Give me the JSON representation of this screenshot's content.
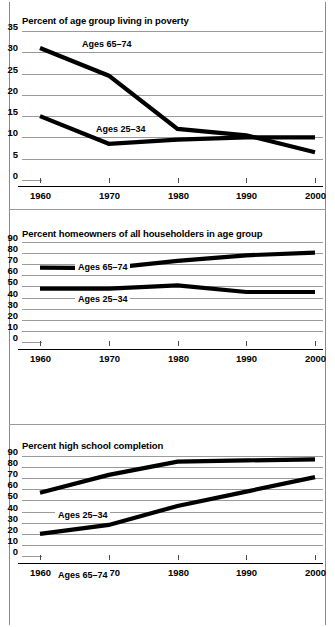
{
  "figure": {
    "panels": [
      "poverty",
      "homeowners",
      "education"
    ],
    "background_color": "#ffffff",
    "line_color": "#000000",
    "gridline_color": "#9a9a9a"
  },
  "poverty": {
    "title": "Percent of age group living in poverty",
    "series_label_older": "Ages 65–74",
    "series_label_younger": "Ages 25–34",
    "ytick_labels": [
      "0",
      "5",
      "10",
      "15",
      "20",
      "25",
      "30",
      "35"
    ],
    "xtick_labels": [
      "1960",
      "1970",
      "1980",
      "1990",
      "2000"
    ]
  },
  "homeowners": {
    "title": "Percent homeowners of all householders in age group",
    "series_label_older": "Ages 65–74",
    "series_label_younger": "Ages 25–34",
    "ytick_labels": [
      "0",
      "10",
      "20",
      "30",
      "40",
      "50",
      "60",
      "70",
      "80",
      "90"
    ],
    "xtick_labels": [
      "1960",
      "1970",
      "1980",
      "1990",
      "2000"
    ]
  },
  "education": {
    "title": "Percent high school completion",
    "series_label_older": "Ages 65–74",
    "series_label_younger": "Ages 25–34",
    "ytick_labels": [
      "0",
      "10",
      "20",
      "30",
      "40",
      "50",
      "60",
      "70",
      "80",
      "90"
    ],
    "xtick_labels": [
      "1960",
      "1970",
      "1980",
      "1990",
      "2000"
    ]
  },
  "chart_data": [
    {
      "type": "line",
      "id": "poverty",
      "title": "Percent of age group living in poverty",
      "xlabel": "",
      "ylabel": "",
      "x": [
        1960,
        1970,
        1980,
        1990,
        2000
      ],
      "categories": [
        "1960",
        "1970",
        "1980",
        "1990",
        "2000"
      ],
      "xlim": [
        1960,
        2000
      ],
      "ylim": [
        0,
        35
      ],
      "yticks": [
        0,
        5,
        10,
        15,
        20,
        25,
        30,
        35
      ],
      "grid": true,
      "legend": "inline-labels",
      "series": [
        {
          "name": "Ages 65–74",
          "values": [
            31,
            24.5,
            12,
            10.5,
            6.5
          ]
        },
        {
          "name": "Ages 25–34",
          "values": [
            15,
            8.5,
            9.5,
            10,
            10
          ]
        }
      ]
    },
    {
      "type": "line",
      "id": "homeowners",
      "title": "Percent homeowners of all householders in age group",
      "xlabel": "",
      "ylabel": "",
      "x": [
        1960,
        1970,
        1980,
        1990,
        2000
      ],
      "categories": [
        "1960",
        "1970",
        "1980",
        "1990",
        "2000"
      ],
      "xlim": [
        1960,
        2000
      ],
      "ylim": [
        0,
        90
      ],
      "yticks": [
        0,
        10,
        20,
        30,
        40,
        50,
        60,
        70,
        80,
        90
      ],
      "grid": true,
      "legend": "inline-labels",
      "series": [
        {
          "name": "Ages 65–74",
          "values": [
            67,
            66.5,
            73,
            78,
            80.5
          ]
        },
        {
          "name": "Ages 25–34",
          "values": [
            48,
            48,
            51,
            45,
            45
          ]
        }
      ]
    },
    {
      "type": "line",
      "id": "education",
      "title": "Percent high school completion",
      "xlabel": "",
      "ylabel": "",
      "x": [
        1960,
        1970,
        1980,
        1990,
        2000
      ],
      "categories": [
        "1960",
        "1970",
        "1980",
        "1990",
        "2000"
      ],
      "xlim": [
        1960,
        2000
      ],
      "ylim": [
        0,
        90
      ],
      "yticks": [
        0,
        10,
        20,
        30,
        40,
        50,
        60,
        70,
        80,
        90
      ],
      "grid": true,
      "legend": "inline-labels",
      "series": [
        {
          "name": "Ages 25–34",
          "values": [
            57,
            73,
            85,
            86,
            87
          ]
        },
        {
          "name": "Ages 65–74",
          "values": [
            20,
            28,
            45,
            58,
            71
          ]
        }
      ]
    }
  ]
}
